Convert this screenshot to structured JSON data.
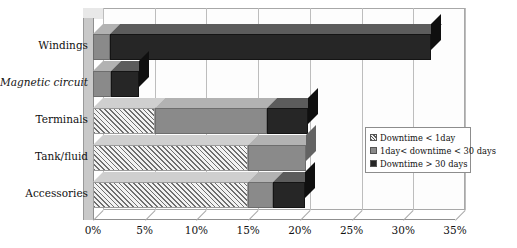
{
  "chart_data": {
    "type": "bar",
    "orientation": "horizontal",
    "stacked": true,
    "title": "",
    "xlabel": "",
    "ylabel": "",
    "xlim": [
      0,
      35
    ],
    "xticks": [
      "0%",
      "5%",
      "10%",
      "15%",
      "20%",
      "25%",
      "30%",
      "35%"
    ],
    "xtick_values": [
      0,
      5,
      10,
      15,
      20,
      25,
      30,
      35
    ],
    "grid": true,
    "legend_position": "center-right",
    "categories": [
      "Windings",
      "Magnetic circuit",
      "Terminals",
      "Tank/fluid",
      "Accessories"
    ],
    "series": [
      {
        "name": "Downtime < 1day",
        "color": "#e4e4e4",
        "pattern": "diagonal-hatch",
        "values": [
          0,
          0,
          6.0,
          15.0,
          15.0
        ]
      },
      {
        "name": "1day< downtime < 30 days",
        "color": "#8a8a8a",
        "pattern": "solid",
        "values": [
          1.6,
          1.7,
          10.8,
          5.6,
          2.4
        ]
      },
      {
        "name": "Downtime > 30 days",
        "color": "#262626",
        "pattern": "solid",
        "values": [
          31.1,
          2.7,
          4.0,
          0,
          3.1
        ]
      }
    ],
    "totals": [
      32.7,
      4.4,
      20.8,
      20.6,
      20.5
    ]
  },
  "legend": {
    "items": [
      {
        "label": "Downtime < 1day",
        "swatch": "hatch"
      },
      {
        "label": "1day< downtime < 30 days",
        "swatch": "mid"
      },
      {
        "label": "Downtime > 30 days",
        "swatch": "dark"
      }
    ]
  }
}
